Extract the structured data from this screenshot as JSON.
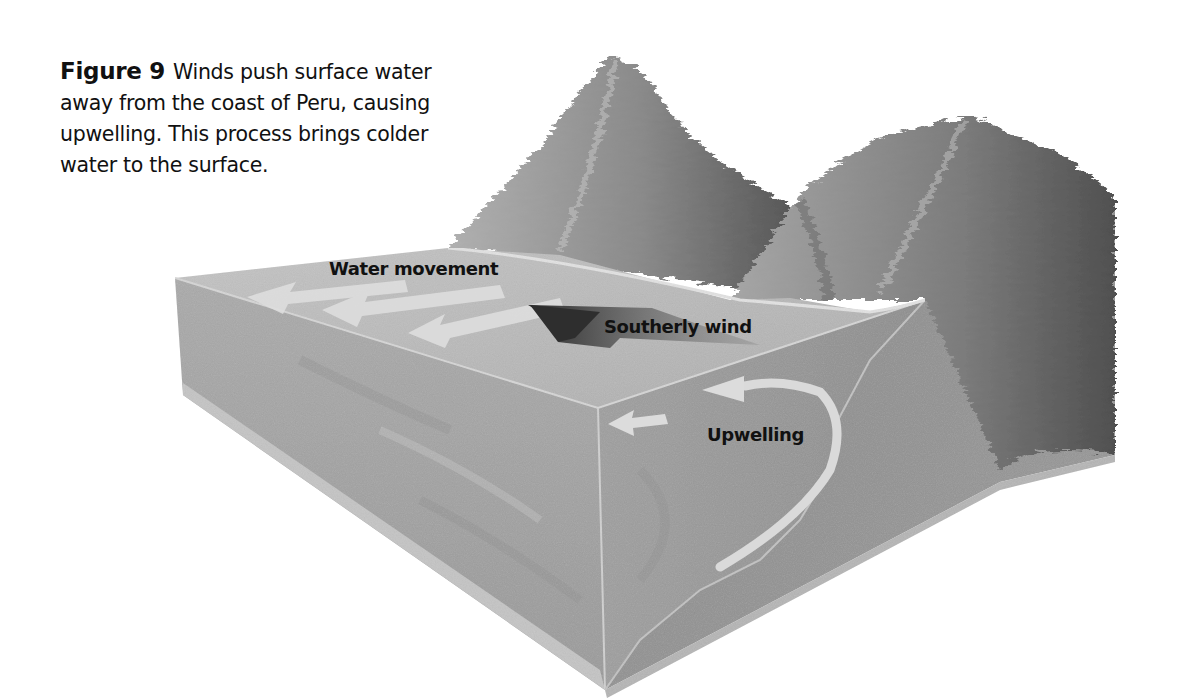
{
  "caption": {
    "figure_label": "Figure 9",
    "text": "Winds push surface water away from the coast of Peru, causing upwelling. This process brings colder water to the surface."
  },
  "diagram": {
    "type": "block diagram",
    "style": "grayscale illustration",
    "labels": {
      "water_movement": "Water movement",
      "southerly_wind": "Southerly wind",
      "upwelling": "Upwelling"
    },
    "elements": [
      "ocean-block",
      "coastal-mountains",
      "surface-water-arrows",
      "wind-arrow",
      "upwelling-arrows"
    ],
    "colors": {
      "ocean_top": "#b9b9b9",
      "ocean_front": "#a3a3a3",
      "ocean_side": "#9c9c9c",
      "land": "#8c8c8c",
      "mountain_light": "#a8a8a8",
      "mountain_dark": "#5e5e5e",
      "water_arrow": "#dcdcdc",
      "wind_arrow": "#3a3a3a",
      "text": "#111111"
    }
  }
}
